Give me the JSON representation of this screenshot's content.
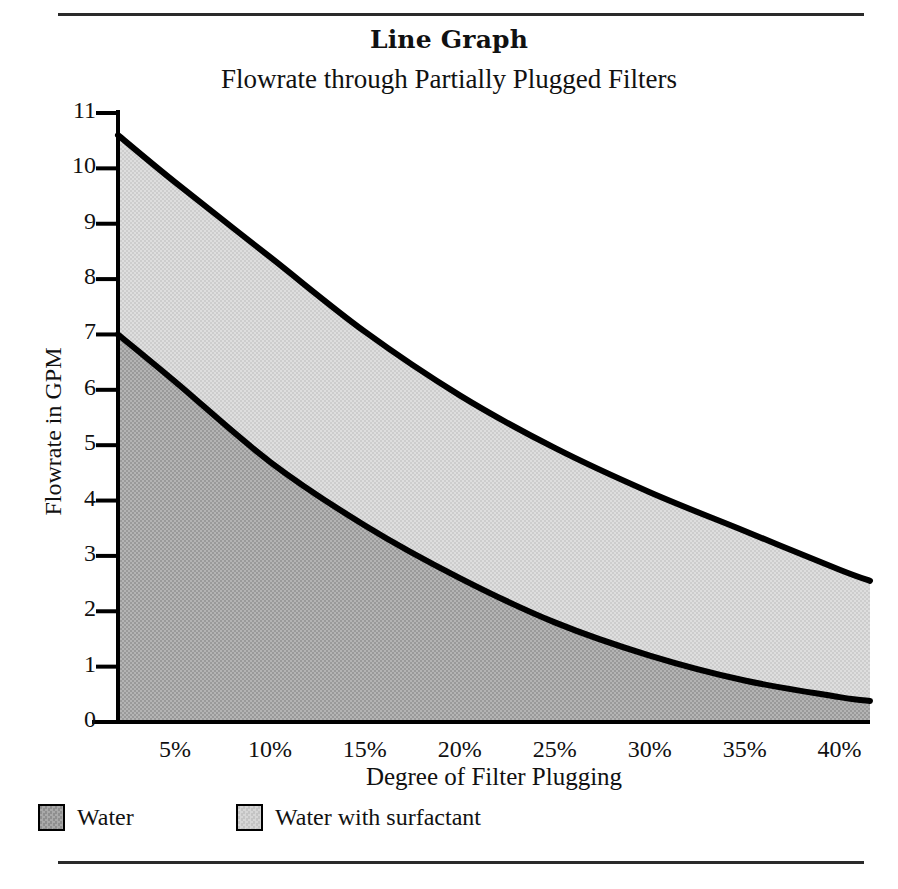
{
  "figure": {
    "title": "Line Graph",
    "subtitle": "Flowrate through Partially Plugged Filters"
  },
  "colors": {
    "water_fill": "#a9a9a9",
    "surfactant_fill": "#d6d6d6",
    "line": "#000000",
    "axis": "#000000",
    "rule": "#2a2a2a",
    "text": "#111111"
  },
  "legend": {
    "position": "bottom-left",
    "items": [
      {
        "label": "Water",
        "color": "#a9a9a9"
      },
      {
        "label": "Water with surfactant",
        "color": "#d6d6d6"
      }
    ]
  },
  "chart_data": {
    "type": "area",
    "title": "Flowrate through Partially Plugged Filters",
    "xlabel": "Degree of Filter Plugging",
    "ylabel": "Flowrate in GPM",
    "xlim": [
      2,
      41.6
    ],
    "ylim": [
      0,
      11
    ],
    "grid": false,
    "stacked": false,
    "x_tick_labels": [
      "5%",
      "10%",
      "15%",
      "20%",
      "25%",
      "30%",
      "35%",
      "40%"
    ],
    "x_tick_values": [
      5,
      10,
      15,
      20,
      25,
      30,
      35,
      40
    ],
    "y_tick_labels": [
      "0",
      "1",
      "2",
      "3",
      "4",
      "5",
      "6",
      "7",
      "8",
      "9",
      "10",
      "11"
    ],
    "y_tick_values": [
      0,
      1,
      2,
      3,
      4,
      5,
      6,
      7,
      8,
      9,
      10,
      11
    ],
    "x": [
      2,
      5,
      10,
      15,
      20,
      25,
      30,
      35,
      40,
      41.6
    ],
    "series": [
      {
        "name": "Water with surfactant",
        "color": "#d6d6d6",
        "values": [
          10.6,
          9.75,
          8.4,
          7.05,
          5.9,
          4.95,
          4.15,
          3.45,
          2.75,
          2.55
        ]
      },
      {
        "name": "Water",
        "color": "#a9a9a9",
        "values": [
          7.0,
          6.15,
          4.7,
          3.55,
          2.6,
          1.8,
          1.2,
          0.75,
          0.45,
          0.38
        ]
      }
    ]
  }
}
